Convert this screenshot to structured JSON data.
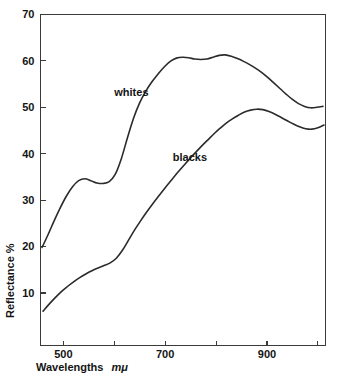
{
  "chart_data": {
    "type": "line",
    "title": "",
    "subtitle": "",
    "xlabel": "Wavelengths",
    "xlabel_unit": "mμ",
    "ylabel": "Reflectance %",
    "xlim": [
      455,
      1015
    ],
    "ylim": [
      0,
      70
    ],
    "grid": false,
    "legend_position": "inline-annotation",
    "x_ticks": [
      500,
      600,
      700,
      800,
      900,
      1000
    ],
    "x_tick_labels": [
      "500",
      "",
      "700",
      "",
      "900",
      ""
    ],
    "y_ticks": [
      10,
      20,
      30,
      40,
      50,
      60,
      70
    ],
    "y_tick_labels": [
      "10",
      "20",
      "30",
      "40",
      "50",
      "60",
      "70"
    ],
    "series": [
      {
        "name": "whites",
        "label": "whites",
        "label_x": 600,
        "label_y": 52.5,
        "color": "#2b2b2b",
        "x": [
          458,
          470,
          482,
          494,
          506,
          518,
          530,
          542,
          554,
          566,
          578,
          590,
          602,
          614,
          626,
          638,
          650,
          662,
          674,
          686,
          698,
          710,
          722,
          734,
          746,
          758,
          770,
          782,
          794,
          806,
          818,
          830,
          842,
          854,
          866,
          878,
          890,
          902,
          914,
          926,
          938,
          950,
          962,
          974,
          986,
          998,
          1010
        ],
        "y": [
          19.8,
          22.6,
          25.6,
          28.4,
          30.9,
          32.9,
          34.2,
          34.6,
          34.2,
          33.7,
          33.6,
          34.0,
          35.6,
          39.0,
          43.5,
          47.7,
          51.0,
          53.5,
          55.5,
          57.2,
          58.7,
          59.9,
          60.6,
          60.8,
          60.7,
          60.4,
          60.3,
          60.4,
          60.8,
          61.2,
          61.3,
          61.0,
          60.5,
          59.9,
          59.2,
          58.4,
          57.5,
          56.4,
          55.2,
          54.0,
          52.8,
          51.7,
          50.8,
          50.2,
          49.9,
          50.0,
          50.2
        ]
      },
      {
        "name": "blacks",
        "label": "blacks",
        "label_x": 715,
        "label_y": 38.5,
        "color": "#2b2b2b",
        "x": [
          460,
          472,
          484,
          496,
          508,
          520,
          532,
          544,
          556,
          568,
          580,
          592,
          604,
          616,
          628,
          640,
          652,
          664,
          676,
          688,
          700,
          712,
          724,
          736,
          748,
          760,
          772,
          784,
          796,
          808,
          820,
          832,
          844,
          856,
          868,
          880,
          892,
          904,
          916,
          928,
          940,
          952,
          964,
          976,
          988,
          1000,
          1012
        ],
        "y": [
          6.1,
          7.6,
          9.0,
          10.3,
          11.4,
          12.4,
          13.3,
          14.1,
          14.8,
          15.4,
          15.9,
          16.5,
          17.5,
          19.2,
          21.4,
          23.6,
          25.6,
          27.5,
          29.3,
          31.0,
          32.7,
          34.3,
          35.9,
          37.4,
          38.9,
          40.3,
          41.7,
          43.0,
          44.3,
          45.5,
          46.6,
          47.5,
          48.3,
          49.0,
          49.4,
          49.6,
          49.5,
          49.1,
          48.5,
          47.8,
          47.1,
          46.4,
          45.8,
          45.4,
          45.3,
          45.6,
          46.2
        ]
      }
    ]
  },
  "figure": {
    "caption": ""
  }
}
